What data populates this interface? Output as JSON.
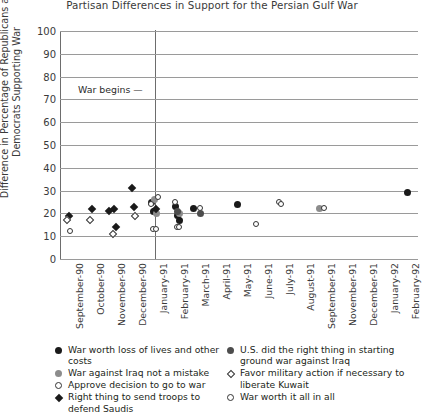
{
  "chart_data": {
    "type": "scatter",
    "title": "Partisan Differences in Support for the Persian Gulf War",
    "xlabel": "",
    "ylabel": "Difference in Percentage of Republicans and Democrats Supporting War",
    "ylim": [
      0,
      100
    ],
    "yticks": [
      0,
      10,
      20,
      30,
      40,
      50,
      60,
      70,
      80,
      90,
      100
    ],
    "grid": true,
    "legend_position": "below-plot",
    "categories": [
      "September-90",
      "October-90",
      "November-90",
      "December-90",
      "January-91",
      "February-91",
      "March-91",
      "April-91",
      "May-91",
      "June-91",
      "July-91",
      "August-91",
      "September-91",
      "November-91",
      "December-91",
      "January-92",
      "February-92"
    ],
    "annotations": [
      {
        "text": "War begins —",
        "at_category": "January-91",
        "note": "vertical reference line"
      }
    ],
    "series": [
      {
        "name": "War worth loss of lives and other costs",
        "marker": "filled-circle",
        "points": [
          {
            "x": "January-91",
            "y": 25
          },
          {
            "x": "January-91",
            "y": 21
          },
          {
            "x": "February-91",
            "y": 23
          },
          {
            "x": "February-91",
            "y": 19
          },
          {
            "x": "February-91",
            "y": 17
          },
          {
            "x": "March-91",
            "y": 22
          },
          {
            "x": "May-91",
            "y": 24
          },
          {
            "x": "February-92",
            "y": 29
          }
        ]
      },
      {
        "name": "War against Iraq not a mistake",
        "marker": "gray-circle",
        "points": [
          {
            "x": "January-91",
            "y": 26
          },
          {
            "x": "January-91",
            "y": 20
          },
          {
            "x": "February-91",
            "y": 20
          },
          {
            "x": "September-91",
            "y": 22
          }
        ]
      },
      {
        "name": "Approve decision to go to war",
        "marker": "open-circle",
        "points": [
          {
            "x": "January-91",
            "y": 27
          },
          {
            "x": "January-91",
            "y": 24
          },
          {
            "x": "January-91",
            "y": 13
          },
          {
            "x": "February-91",
            "y": 25
          },
          {
            "x": "February-91",
            "y": 14
          },
          {
            "x": "March-91",
            "y": 22
          },
          {
            "x": "June-91",
            "y": 15
          },
          {
            "x": "July-91",
            "y": 25
          },
          {
            "x": "July-91",
            "y": 24
          },
          {
            "x": "September-91",
            "y": 22
          }
        ]
      },
      {
        "name": "Right thing to send troops to defend Saudis",
        "marker": "filled-diamond",
        "points": [
          {
            "x": "September-90",
            "y": 19
          },
          {
            "x": "October-90",
            "y": 22
          },
          {
            "x": "November-90",
            "y": 22
          },
          {
            "x": "November-90",
            "y": 14
          },
          {
            "x": "November-90",
            "y": 21
          },
          {
            "x": "December-90",
            "y": 31
          },
          {
            "x": "December-90",
            "y": 23
          },
          {
            "x": "January-91",
            "y": 22
          }
        ]
      },
      {
        "name": "U.S. did the right thing in starting ground war against Iraq",
        "marker": "dark-circle",
        "points": [
          {
            "x": "February-91",
            "y": 21
          },
          {
            "x": "March-91",
            "y": 20
          }
        ]
      },
      {
        "name": "Favor military action if necessary to liberate Kuwait",
        "marker": "open-diamond",
        "points": [
          {
            "x": "September-90",
            "y": 17
          },
          {
            "x": "October-90",
            "y": 17
          },
          {
            "x": "November-90",
            "y": 11
          },
          {
            "x": "December-90",
            "y": 19
          }
        ]
      },
      {
        "name": "War worth it all in all",
        "marker": "open-circle",
        "points": [
          {
            "x": "September-90",
            "y": 12
          },
          {
            "x": "January-91",
            "y": 13
          },
          {
            "x": "February-91",
            "y": 14
          }
        ]
      }
    ]
  },
  "legend": {
    "left_column": [
      {
        "marker": "fc",
        "label": "War worth loss of lives and other costs"
      },
      {
        "marker": "gc",
        "label": "War against Iraq not a mistake"
      },
      {
        "marker": "oc",
        "label": "Approve decision to go to war"
      },
      {
        "marker": "fd",
        "label": "Right thing to send troops to defend Saudis"
      }
    ],
    "right_column": [
      {
        "marker": "dc",
        "label": "U.S. did the right thing in starting ground war against Iraq"
      },
      {
        "marker": "od",
        "label": "Favor military action if necessary to liberate Kuwait"
      },
      {
        "marker": "oc",
        "label": "War worth it all in all"
      }
    ]
  }
}
